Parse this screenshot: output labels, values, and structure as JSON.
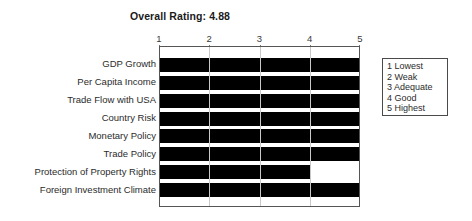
{
  "chart_data": {
    "type": "bar",
    "orientation": "horizontal",
    "title": "Overall Rating: 4.88",
    "xlabel": "",
    "ylabel": "",
    "xlim": [
      1,
      5
    ],
    "grid": true,
    "legend_position": "right",
    "xticks": [
      "1",
      "2",
      "3",
      "4",
      "5"
    ],
    "categories": [
      "GDP Growth",
      "Per Capita Income",
      "Trade Flow with USA",
      "Country Risk",
      "Monetary Policy",
      "Trade Policy",
      "Protection of Property Rights",
      "Foreign Investment Climate"
    ],
    "values": [
      5,
      5,
      5,
      5,
      5,
      5,
      4,
      5
    ],
    "bar_color": "#000000",
    "legend_entries": [
      "1 Lowest",
      "2 Weak",
      "3 Adequate",
      "4 Good",
      "5 Highest"
    ]
  }
}
